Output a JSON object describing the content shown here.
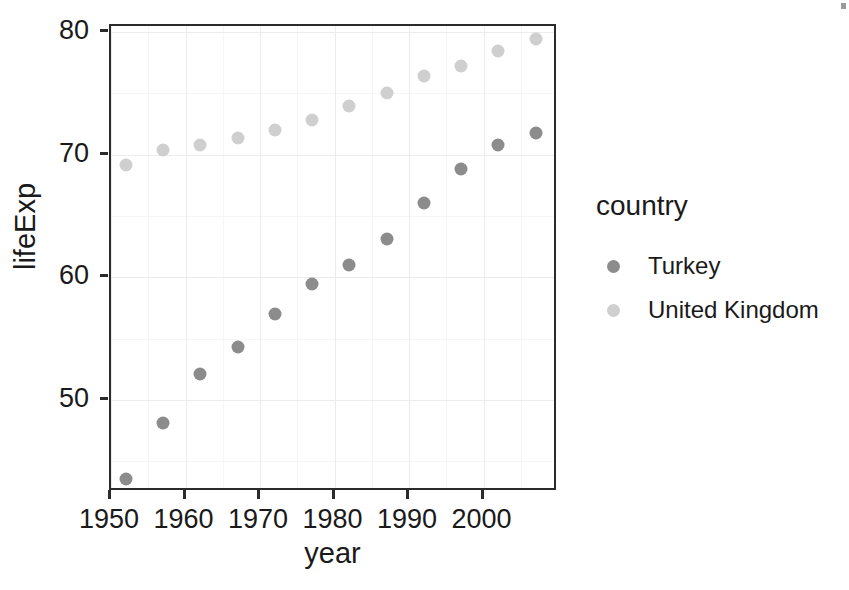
{
  "chart_data": {
    "type": "scatter",
    "title": "",
    "xlabel": "year",
    "ylabel": "lifeExp",
    "xlim": [
      1950,
      2010
    ],
    "ylim": [
      42.5,
      80.5
    ],
    "x_ticks": [
      1950,
      1960,
      1970,
      1980,
      1990,
      2000
    ],
    "y_ticks": [
      50,
      60,
      70,
      80
    ],
    "grid": true,
    "legend_position": "right",
    "legend_title": "country",
    "series": [
      {
        "name": "Turkey",
        "color": "#8c8c8c",
        "x": [
          1952,
          1957,
          1962,
          1967,
          1972,
          1977,
          1982,
          1987,
          1992,
          1997,
          2002,
          2007
        ],
        "values": [
          43.6,
          48.1,
          52.1,
          54.3,
          57.0,
          59.5,
          61.0,
          63.1,
          66.1,
          68.8,
          70.8,
          71.8
        ]
      },
      {
        "name": "United Kingdom",
        "color": "#cfcfcf",
        "x": [
          1952,
          1957,
          1962,
          1967,
          1972,
          1977,
          1982,
          1987,
          1992,
          1997,
          2002,
          2007
        ],
        "values": [
          69.2,
          70.4,
          70.8,
          71.4,
          72.0,
          72.8,
          74.0,
          75.0,
          76.4,
          77.2,
          78.5,
          79.4
        ]
      }
    ]
  },
  "axis": {
    "x_title": "year",
    "y_title": "lifeExp",
    "x_tick_labels": [
      "1950",
      "1960",
      "1970",
      "1980",
      "1990",
      "2000"
    ],
    "y_tick_labels": [
      "50",
      "60",
      "70",
      "80"
    ]
  },
  "legend": {
    "title": "country",
    "items": [
      {
        "label": "Turkey",
        "color": "#8c8c8c"
      },
      {
        "label": "United Kingdom",
        "color": "#cfcfcf"
      }
    ]
  },
  "theme": {
    "panel_border": "#2b2b2b",
    "panel_background": "#ffffff",
    "grid_major": "#ececec",
    "grid_minor": "#f6f6f6",
    "text_color": "#1a1a1a"
  }
}
